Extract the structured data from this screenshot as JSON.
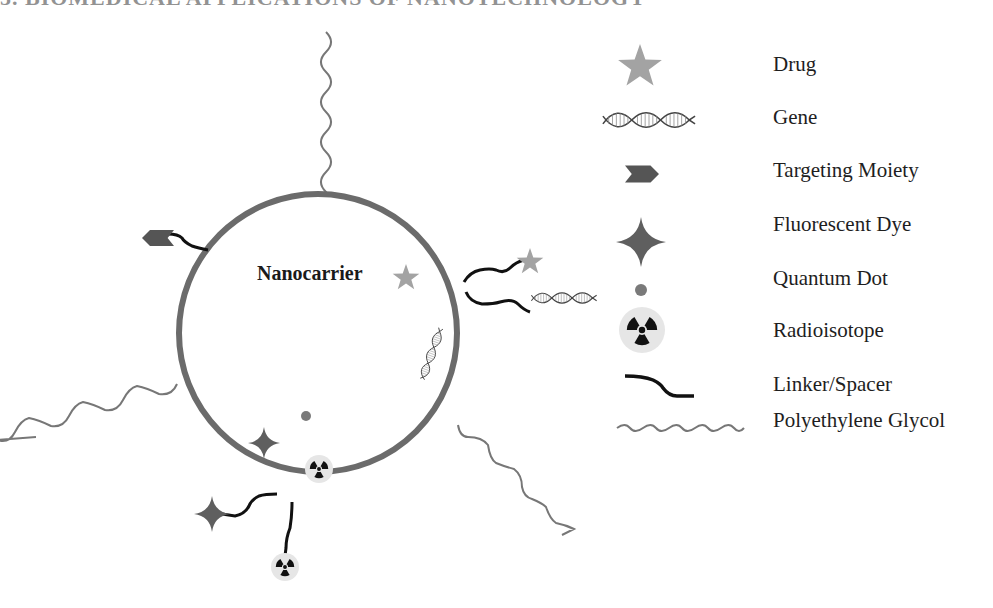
{
  "title": "5. BIOMEDICAL APPLICATIONS OF NANOTECHNOLOGY",
  "diagram": {
    "center_label": "Nanocarrier",
    "colors": {
      "membrane": "#6b6b6b",
      "drug": "#a3a3a3",
      "targeting_moiety": "#555555",
      "fluorescent_dye": "#5f5f5f",
      "quantum_dot": "#7a7a7a",
      "linker": "#111111",
      "peg": "#777777",
      "radio_bg": "#e6e6e6",
      "radio_fg": "#111111"
    },
    "surface_attachments": [
      {
        "type": "Polyethylene Glycol",
        "position": "top"
      },
      {
        "type": "Targeting Moiety",
        "via": "Linker/Spacer",
        "position": "upper-left"
      },
      {
        "type": "Drug",
        "via": "Linker/Spacer",
        "position": "right"
      },
      {
        "type": "Gene",
        "via": "Linker/Spacer",
        "position": "right"
      },
      {
        "type": "Polyethylene Glycol",
        "position": "left"
      },
      {
        "type": "Polyethylene Glycol",
        "position": "lower-right"
      },
      {
        "type": "Fluorescent Dye",
        "via": "Linker/Spacer",
        "position": "bottom-left"
      },
      {
        "type": "Radioisotope",
        "via": "Linker/Spacer",
        "position": "bottom"
      }
    ],
    "encapsulated": [
      {
        "type": "Drug"
      },
      {
        "type": "Gene"
      },
      {
        "type": "Quantum Dot"
      },
      {
        "type": "Fluorescent Dye"
      },
      {
        "type": "Radioisotope"
      }
    ]
  },
  "legend": {
    "items": [
      {
        "label": "Drug",
        "icon": "star-icon"
      },
      {
        "label": "Gene",
        "icon": "dna-helix-icon"
      },
      {
        "label": "Targeting Moiety",
        "icon": "chevron-arrow-icon"
      },
      {
        "label": "Fluorescent Dye",
        "icon": "four-point-star-icon"
      },
      {
        "label": "Quantum Dot",
        "icon": "dot-icon"
      },
      {
        "label": "Radioisotope",
        "icon": "radiation-icon"
      },
      {
        "label": "Linker/Spacer",
        "icon": "linker-curve-icon"
      },
      {
        "label": "Polyethylene Glycol",
        "icon": "wavy-line-icon"
      }
    ]
  }
}
